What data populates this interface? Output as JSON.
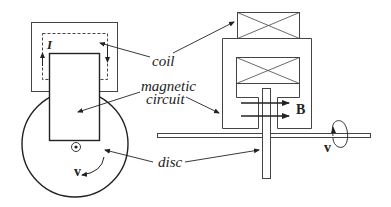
{
  "diagram": {
    "type": "homopolar-generator-schematic",
    "views": [
      "front-view",
      "side-view"
    ],
    "labels": {
      "coil": "coil",
      "magnetic_line1": "magnetic",
      "magnetic_line2": "circuit",
      "disc": "disc"
    },
    "symbols": {
      "current": "I",
      "velocity_left": "v",
      "velocity_right": "v",
      "field": "B"
    },
    "colors": {
      "stroke": "#222222",
      "background": "#ffffff"
    }
  }
}
